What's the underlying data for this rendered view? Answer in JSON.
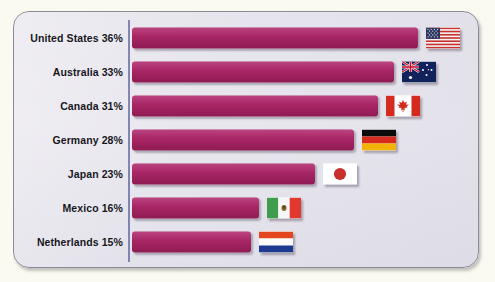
{
  "chart_data": {
    "type": "bar",
    "title": "",
    "subtitle": "",
    "xlabel": "",
    "ylabel": "",
    "orientation": "horizontal",
    "grid": false,
    "legend": "none",
    "xlim": [
      0,
      40
    ],
    "categories": [
      "United States",
      "Australia",
      "Canada",
      "Germany",
      "Japan",
      "Mexico",
      "Netherlands"
    ],
    "values": [
      36,
      33,
      31,
      28,
      23,
      16,
      15
    ],
    "value_suffix": "%",
    "series": [
      {
        "name": "Percentage",
        "values": [
          36,
          33,
          31,
          28,
          23,
          16,
          15
        ]
      }
    ],
    "tick_labels": [
      "United States 36%",
      "Australia 33%",
      "Canada 31%",
      "Germany 28%",
      "Japan 23%",
      "Mexico 16%",
      "Netherlands 15%"
    ],
    "annotations": [
      "flag icon shown at the end of each bar"
    ]
  },
  "colors": {
    "bar": "#a62463",
    "panel_background": "#e6e4ec",
    "page_background": "#fbfaf0",
    "panel_border": "#8b8b95",
    "axis_line": "#6f74a8",
    "label_text": "#15151c"
  },
  "rows": [
    {
      "label": "United States 36%",
      "country": "United States",
      "value": 36,
      "flag": "flag-united-states-icon"
    },
    {
      "label": "Australia 33%",
      "country": "Australia",
      "value": 33,
      "flag": "flag-australia-icon"
    },
    {
      "label": "Canada 31%",
      "country": "Canada",
      "value": 31,
      "flag": "flag-canada-icon"
    },
    {
      "label": "Germany 28%",
      "country": "Germany",
      "value": 28,
      "flag": "flag-germany-icon"
    },
    {
      "label": "Japan 23%",
      "country": "Japan",
      "value": 23,
      "flag": "flag-japan-icon"
    },
    {
      "label": "Mexico 16%",
      "country": "Mexico",
      "value": 16,
      "flag": "flag-mexico-icon"
    },
    {
      "label": "Netherlands 15%",
      "country": "Netherlands",
      "value": 15,
      "flag": "flag-netherlands-icon"
    }
  ]
}
